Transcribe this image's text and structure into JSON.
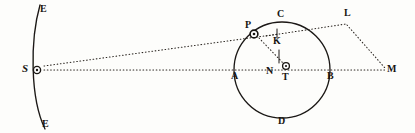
{
  "figure": {
    "kind": "geometric-astronomical-diagram",
    "width": 415,
    "height": 133,
    "background_color": "#fdfdfb",
    "ink_color": "#181512",
    "stroke_color": "#1a1714",
    "dotted_color": "#2a2520"
  },
  "labels": {
    "E_top": "E",
    "E_bottom": "E",
    "S": "S",
    "A": "A",
    "B": "B",
    "C": "C",
    "D": "D",
    "P": "P",
    "K": "K",
    "N": "N",
    "T": "T",
    "L": "L",
    "M": "M"
  },
  "points": {
    "S": {
      "x": 37,
      "y": 70,
      "marker": "circle-dot"
    },
    "E_top": {
      "x": 40,
      "y": 8
    },
    "E_bottom": {
      "x": 42,
      "y": 126
    },
    "A": {
      "x": 235,
      "y": 70,
      "marker": "none"
    },
    "B": {
      "x": 330,
      "y": 70,
      "marker": "none"
    },
    "C": {
      "x": 282,
      "y": 22,
      "marker": "none"
    },
    "D": {
      "x": 282,
      "y": 118,
      "marker": "none"
    },
    "P": {
      "x": 254,
      "y": 33,
      "marker": "circle-dot"
    },
    "K": {
      "x": 277,
      "y": 38,
      "marker": "tick"
    },
    "N": {
      "x": 272,
      "y": 67,
      "marker": "none"
    },
    "T": {
      "x": 286,
      "y": 66,
      "marker": "circle-dot"
    },
    "L": {
      "x": 347,
      "y": 18,
      "marker": "none"
    },
    "M": {
      "x": 390,
      "y": 70,
      "marker": "none"
    }
  },
  "shapes": {
    "arc_EE": {
      "name": "earth-orbit-arc",
      "from": [
        40,
        6
      ],
      "to": [
        44,
        128
      ],
      "bulge": "left"
    },
    "circle_ACBD": {
      "name": "epicycle-circle",
      "cx": 282,
      "cy": 70,
      "r": 48
    }
  },
  "dotted_lines": [
    {
      "name": "line-S-to-A-B-M",
      "from": "S",
      "to": "M"
    },
    {
      "name": "line-S-to-P-to-K",
      "from": "S",
      "to": "K"
    },
    {
      "name": "line-K-to-L",
      "from": "K",
      "to": "L"
    },
    {
      "name": "line-L-to-M",
      "from": "L",
      "to": "M"
    },
    {
      "name": "line-P-to-T",
      "from": "P",
      "to": "T"
    }
  ]
}
